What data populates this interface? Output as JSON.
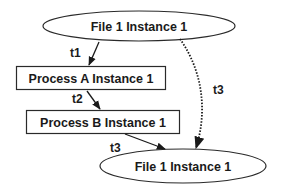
{
  "diagram": {
    "type": "provenance-graph",
    "nodes": [
      {
        "id": "file1_top",
        "shape": "ellipse",
        "label": "File 1 Instance 1"
      },
      {
        "id": "procA",
        "shape": "rectangle",
        "label": "Process A Instance 1"
      },
      {
        "id": "procB",
        "shape": "rectangle",
        "label": "Process B Instance 1"
      },
      {
        "id": "file1_bottom",
        "shape": "ellipse",
        "label": "File 1 Instance 1"
      }
    ],
    "edges": [
      {
        "from": "file1_top",
        "to": "procA",
        "label": "t1",
        "style": "solid"
      },
      {
        "from": "procA",
        "to": "procB",
        "label": "t2",
        "style": "solid"
      },
      {
        "from": "procB",
        "to": "file1_bottom",
        "label": "t3",
        "style": "solid"
      },
      {
        "from": "file1_top",
        "to": "file1_bottom",
        "label": "t3",
        "style": "dotted"
      }
    ],
    "colors": {
      "stroke": "#2a2a2a",
      "text": "#1a1a1a",
      "background": "#ffffff"
    }
  }
}
